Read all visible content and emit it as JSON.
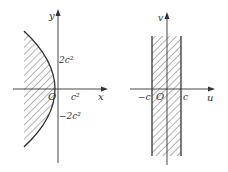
{
  "figures": [
    {
      "name": "parabola-region",
      "axes": {
        "x_label": "x",
        "y_label": "y",
        "origin_label": "O"
      },
      "ticks": {
        "x_vertex": "c²",
        "y_top": "2c²",
        "y_bottom": "−2c²"
      },
      "description": "Region left of parabola y² = 4c²(c² − x), hatched"
    },
    {
      "name": "strip-region",
      "axes": {
        "x_label": "u",
        "y_label": "v",
        "origin_label": "O"
      },
      "ticks": {
        "left": "−c",
        "right": "c"
      },
      "description": "Vertical strip −c < u < c, hatched"
    }
  ],
  "colors": {
    "ink": "#333333",
    "hatch": "#555555",
    "background": "#ffffff"
  }
}
